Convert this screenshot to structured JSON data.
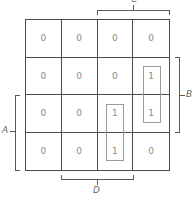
{
  "diagram": {
    "type": "karnaugh-map",
    "rows": [
      [
        "0",
        "0",
        "0",
        "0"
      ],
      [
        "0",
        "0",
        "0",
        "1"
      ],
      [
        "0",
        "0",
        "1",
        "1"
      ],
      [
        "0",
        "0",
        "1",
        "0"
      ]
    ],
    "groups": [
      {
        "name": "group-col4",
        "cells": [
          [
            1,
            3
          ],
          [
            2,
            3
          ]
        ]
      },
      {
        "name": "group-col3",
        "cells": [
          [
            2,
            2
          ],
          [
            3,
            2
          ]
        ]
      }
    ],
    "labels": {
      "A": "A",
      "B": "B",
      "C": "C",
      "D": "D"
    }
  }
}
